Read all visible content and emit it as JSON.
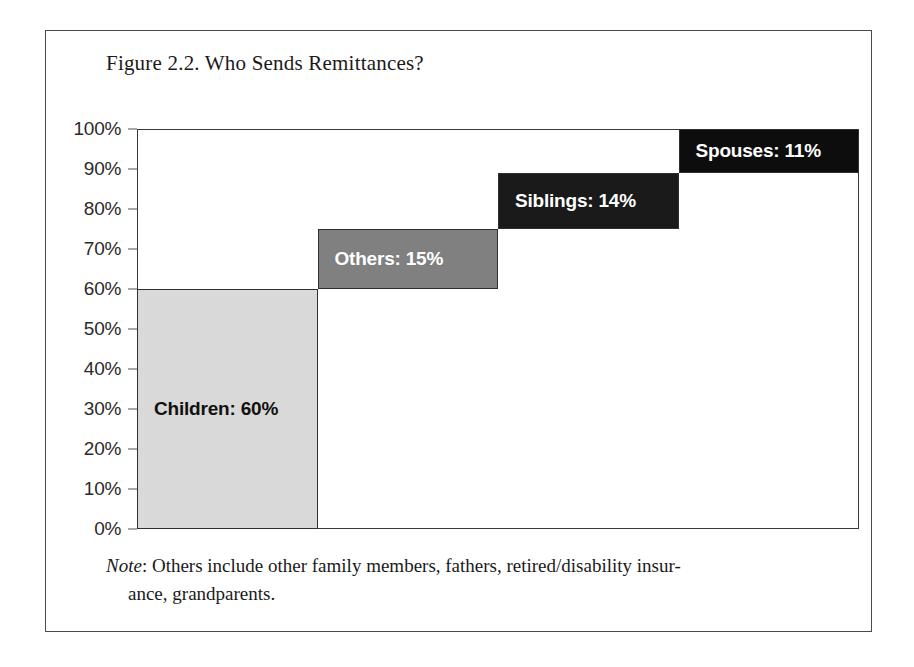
{
  "figure": {
    "title": "Figure 2.2. Who Sends Remittances?",
    "note_label": "Note",
    "note_separator": ": ",
    "note_line1": "Others include other family members, fathers, retired/disability insur-",
    "note_line2": "ance, grandparents."
  },
  "chart_data": {
    "type": "bar",
    "subtype": "waterfall-cumulative",
    "title": "Figure 2.2. Who Sends Remittances?",
    "xlabel": "",
    "ylabel": "",
    "ylim": [
      0,
      100
    ],
    "y_unit": "%",
    "grid": false,
    "legend": "none",
    "categories": [
      "Children",
      "Others",
      "Siblings",
      "Spouses"
    ],
    "values": [
      60,
      15,
      14,
      11
    ],
    "cumulative_start": [
      0,
      60,
      75,
      89
    ],
    "cumulative_end": [
      60,
      75,
      89,
      100
    ],
    "y_ticks": [
      "0%",
      "10%",
      "20%",
      "30%",
      "40%",
      "50%",
      "60%",
      "70%",
      "80%",
      "90%",
      "100%"
    ],
    "y_tick_values": [
      0,
      10,
      20,
      30,
      40,
      50,
      60,
      70,
      80,
      90,
      100
    ],
    "bars": [
      {
        "name": "Children",
        "label": "Children: 60%",
        "value": 60,
        "start": 0,
        "end": 60,
        "color": "#d9d9d9",
        "text_color": "#111111",
        "shade": "light"
      },
      {
        "name": "Others",
        "label": "Others: 15%",
        "value": 15,
        "start": 60,
        "end": 75,
        "color": "#808080",
        "text_color": "#ffffff",
        "shade": "mid"
      },
      {
        "name": "Siblings",
        "label": "Siblings: 14%",
        "value": 14,
        "start": 75,
        "end": 89,
        "color": "#1a1a1a",
        "text_color": "#ffffff",
        "shade": "dark"
      },
      {
        "name": "Spouses",
        "label": "Spouses: 11%",
        "value": 11,
        "start": 89,
        "end": 100,
        "color": "#0d0d0d",
        "text_color": "#ffffff",
        "shade": "darkest"
      }
    ]
  }
}
